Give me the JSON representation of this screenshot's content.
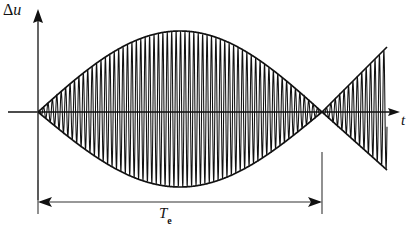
{
  "figure": {
    "background_color": "#ffffff",
    "line_color": "#111111",
    "width": 419,
    "height": 236
  },
  "labels": {
    "y_axis_delta": "Δ",
    "y_axis_variable": "u",
    "y_axis_full": "Δu",
    "x_axis": "t",
    "duration_base": "T",
    "duration_subscript": "e",
    "duration_full": "Tₑ"
  },
  "chart_data": {
    "type": "line",
    "title": "",
    "xlabel": "t",
    "ylabel": "Δu",
    "grid": false,
    "legend": null,
    "axes": {
      "x_axis_y_px": 112,
      "y_axis_x_px": 38,
      "x_axis_start_px": 8,
      "x_axis_end_px": 400,
      "y_axis_top_px": 12,
      "y_axis_bottom_px": 200,
      "x_arrow": "right",
      "y_arrow": "up"
    },
    "carrier": {
      "period_px": 4.42,
      "cycles_visible": 79,
      "start_x_px": 38,
      "end_x_px": 387
    },
    "envelope": {
      "shape": "absolute sine (beat envelope)",
      "node_x_px": 322,
      "first_lobe": {
        "start_x_px": 38,
        "end_x_px": 322,
        "peak_x_px": 180,
        "peak_top_y_px": 31,
        "peak_bottom_y_px": 187,
        "peak_amplitude_px": 81
      },
      "second_lobe": {
        "start_x_px": 322,
        "end_x_px": 387,
        "shape": "rising linear ramp",
        "end_top_y_px": 47,
        "end_bottom_y_px": 170,
        "end_amplitude_px": 62
      }
    },
    "annotation": {
      "name": "beat-period-dimension",
      "label": "Tₑ",
      "from_x_px": 38,
      "to_x_px": 322,
      "y_px": 202,
      "arrows": "both",
      "extension_lines": [
        {
          "x_px": 38,
          "y_top_px": 180,
          "y_bottom_px": 214
        },
        {
          "x_px": 322,
          "y_top_px": 152,
          "y_bottom_px": 214
        }
      ]
    }
  }
}
